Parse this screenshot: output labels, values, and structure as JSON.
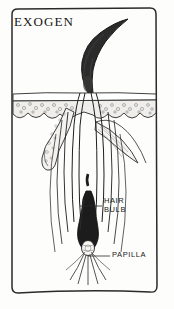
{
  "figure": {
    "title": "EXOGEN",
    "style": "hand-drawn ink illustration",
    "background_color": "#fdfdfb",
    "ink_color": "#1a1a1a"
  },
  "labels": {
    "hair_bulb": "HAIR\nBULB",
    "hair_bulb_line1": "HAIR",
    "hair_bulb_line2": "BULB",
    "papilla": "PAPILLA"
  },
  "structures": [
    {
      "name": "club-hair",
      "description": "detached tapered dark hair shaft above skin"
    },
    {
      "name": "epidermis",
      "description": "stippled horizontal skin band"
    },
    {
      "name": "sebaceous-gland",
      "description": "stippled lobed gland left of follicle"
    },
    {
      "name": "arrector-pili-muscle",
      "description": "striated spindle muscle right of follicle"
    },
    {
      "name": "follicle-canal",
      "description": "vertical sheath channel"
    },
    {
      "name": "hair-bulb",
      "description": "dark club shaped bulb"
    },
    {
      "name": "dermal-papilla",
      "description": "small oval at base of bulb"
    },
    {
      "name": "root-fibers",
      "description": "radiating strands below papilla"
    }
  ]
}
